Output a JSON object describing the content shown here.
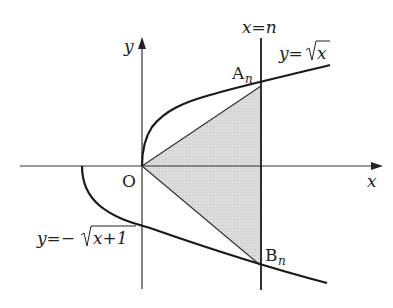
{
  "diagram": {
    "axes": {
      "x_label": "x",
      "y_label": "y",
      "origin_label": "O"
    },
    "curves": {
      "upper": {
        "equation_prefix": "y=",
        "radicand": "x",
        "label": "y=√x"
      },
      "lower": {
        "equation_prefix": "y=−",
        "radicand": "x+1",
        "label": "y=−√(x+1)"
      }
    },
    "vertical_line": {
      "label": "x=n"
    },
    "points": {
      "A": {
        "letter": "A",
        "subscript": "n"
      },
      "B": {
        "letter": "B",
        "subscript": "n"
      }
    },
    "shaded_region": {
      "description": "triangle O A_n B_n",
      "fill": "#d9d9d9"
    },
    "colors": {
      "stroke": "#1a1a1a",
      "shade": "#d9d9d9",
      "background": "#ffffff"
    }
  }
}
